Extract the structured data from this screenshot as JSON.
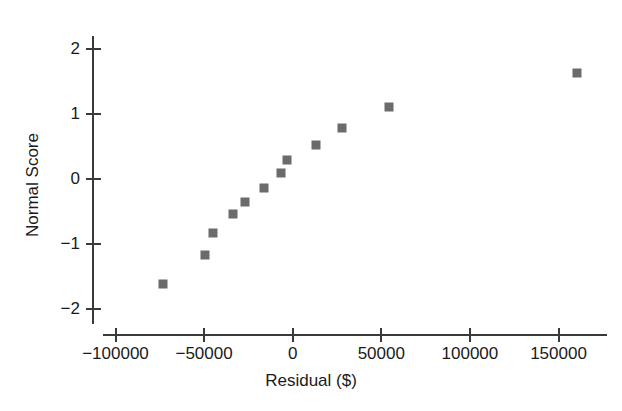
{
  "chart_data": {
    "type": "scatter",
    "title": "",
    "xlabel": "Residual ($)",
    "ylabel": "Normal Score",
    "xlim": [
      -118000,
      180000
    ],
    "ylim": [
      -2.3,
      2.25
    ],
    "grid": false,
    "legend": "none",
    "marker": {
      "shape": "square",
      "color": "#6b6b6b",
      "size_px": 9
    },
    "xticks": [
      -100000,
      -50000,
      0,
      50000,
      100000,
      150000
    ],
    "xtick_labels": [
      "-100000",
      "-50000",
      "0",
      "50000",
      "100000",
      "150000"
    ],
    "yticks": [
      2,
      1,
      0,
      -1,
      -2
    ],
    "ytick_labels": [
      "2",
      "1",
      "0",
      "-1",
      "-2"
    ],
    "points": [
      {
        "x": -73000,
        "y": -1.62
      },
      {
        "x": -49400,
        "y": -1.17
      },
      {
        "x": -45200,
        "y": -0.83
      },
      {
        "x": -33900,
        "y": -0.54
      },
      {
        "x": -26900,
        "y": -0.35
      },
      {
        "x": -16000,
        "y": -0.14
      },
      {
        "x": -6800,
        "y": 0.1
      },
      {
        "x": -3050,
        "y": 0.29
      },
      {
        "x": 13150,
        "y": 0.52
      },
      {
        "x": 27650,
        "y": 0.78
      },
      {
        "x": 54500,
        "y": 1.11
      },
      {
        "x": 160600,
        "y": 1.63
      }
    ]
  },
  "axes": {
    "x_title": "Residual ($)",
    "y_title": "Normal Score"
  },
  "colors": {
    "marker": "#6b6b6b",
    "axis": "#3a3a3a",
    "text": "#1a1a1a",
    "background": "#ffffff"
  }
}
